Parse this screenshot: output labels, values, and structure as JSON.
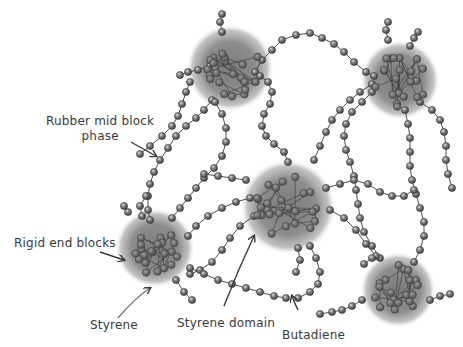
{
  "diagram": {
    "colors": {
      "domain": "#8a8a8a",
      "bead": "#6e6e6e",
      "bead_highlight": "#d8d8d8",
      "chain": "#3a3a3a",
      "text": "#3a3a3a"
    },
    "labels": [
      {
        "id": "rubber-mid-block",
        "text_line1": "Rubber mid block",
        "text_line2": "phase"
      },
      {
        "id": "rigid-end-blocks",
        "text": "Rigid end blocks"
      },
      {
        "id": "styrene",
        "text": "Styrene"
      },
      {
        "id": "styrene-domain",
        "text": "Styrene domain"
      },
      {
        "id": "butadiene",
        "text": "Butadiene"
      }
    ],
    "domains": [
      {
        "id": "domain-top-left",
        "cx": 230,
        "cy": 68,
        "r": 42
      },
      {
        "id": "domain-top-right",
        "cx": 400,
        "cy": 80,
        "r": 38
      },
      {
        "id": "domain-center",
        "cx": 288,
        "cy": 207,
        "r": 45
      },
      {
        "id": "domain-left",
        "cx": 155,
        "cy": 248,
        "r": 38
      },
      {
        "id": "domain-bottom-right",
        "cx": 398,
        "cy": 290,
        "r": 36
      }
    ]
  }
}
